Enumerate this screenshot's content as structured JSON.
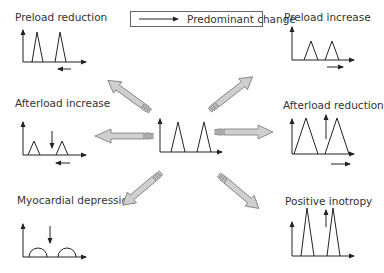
{
  "legend": {
    "icon": "arrow-right-icon",
    "label": "Predominant change"
  },
  "panels": [
    {
      "id": "preload-reduction",
      "label": "Preload reduction",
      "annotation": "arrow-left-below-axis"
    },
    {
      "id": "preload-increase",
      "label": "Preload increase",
      "annotation": "arrow-right-below-axis"
    },
    {
      "id": "afterload-increase",
      "label": "Afterload increase",
      "annotation": "arrow-down-and-arrow-left"
    },
    {
      "id": "afterload-reduction",
      "label": "Afterload reduction",
      "annotation": "arrow-up-and-arrow-right"
    },
    {
      "id": "myocardial-depression",
      "label": "Myocardial depression",
      "annotation": "arrow-down"
    },
    {
      "id": "positive-inotropy",
      "label": "Positive inotropy",
      "annotation": "arrow-up"
    }
  ],
  "center": {
    "id": "baseline",
    "label": ""
  },
  "colors": {
    "arrow_fill": "#cfcfcf",
    "arrow_stroke": "#777777",
    "line": "#222222",
    "text": "#333333"
  }
}
